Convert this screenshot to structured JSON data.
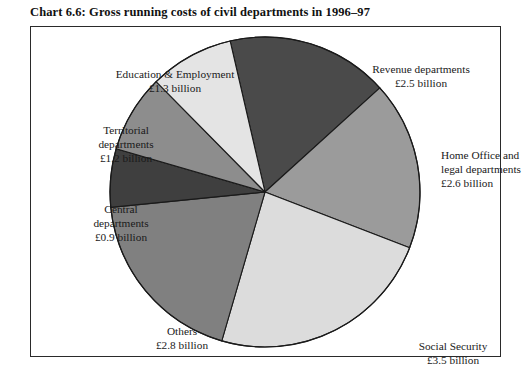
{
  "chart_title": "Chart 6.6: Gross running costs of civil departments in 1996–97",
  "chart_data": {
    "type": "pie",
    "title": "Chart 6.6: Gross running costs of civil departments in 1996–97",
    "unit": "£ billion",
    "total": 14.8,
    "legend": "none",
    "labels_inline": true,
    "categories": [
      "Revenue departments",
      "Home Office and legal departments",
      "Social Security",
      "Others",
      "Central departments",
      "Territorial departments",
      "Education & Employment"
    ],
    "values": [
      2.5,
      2.6,
      3.5,
      2.8,
      0.9,
      1.2,
      1.3
    ],
    "value_labels": [
      "£2.5 billion",
      "£2.6 billion",
      "£3.5 billion",
      "£2.8 billion",
      "£0.9 billion",
      "£1.2 billion",
      "£1.3 billion"
    ],
    "colors": [
      "#4a4a4a",
      "#9b9b9b",
      "#dcdcdc",
      "#808080",
      "#3f3f3f",
      "#8d8d8d",
      "#e4e4e4"
    ],
    "start_angle_deg": -13,
    "direction": "clockwise"
  },
  "slices": [
    {
      "key": "revenue",
      "name_line1": "Revenue departments",
      "name_line2": "£2.5 billion",
      "value": 2.5,
      "color": "#4a4a4a"
    },
    {
      "key": "home-office",
      "name_line1": "Home Office and",
      "name_line2": "legal departments",
      "name_line3": "£2.6 billion",
      "value": 2.6,
      "color": "#9b9b9b"
    },
    {
      "key": "social-security",
      "name_line1": "Social Security",
      "name_line2": "£3.5 billion",
      "value": 3.5,
      "color": "#dcdcdc"
    },
    {
      "key": "others",
      "name_line1": "Others",
      "name_line2": "£2.8 billion",
      "value": 2.8,
      "color": "#808080"
    },
    {
      "key": "central",
      "name_line1": "Central",
      "name_line2": "departments",
      "name_line3": "£0.9 billion",
      "value": 0.9,
      "color": "#3f3f3f"
    },
    {
      "key": "territorial",
      "name_line1": "Territorial",
      "name_line2": "departments",
      "name_line3": "£1.2 billion",
      "value": 1.2,
      "color": "#8d8d8d"
    },
    {
      "key": "education",
      "name_line1": "Education & Employment",
      "name_line2": "£1.3 billion",
      "value": 1.3,
      "color": "#e4e4e4"
    }
  ],
  "style": {
    "slice_outline": "#1a1a1a",
    "frame_border": "#2a2a2a",
    "background": "#ffffff"
  }
}
